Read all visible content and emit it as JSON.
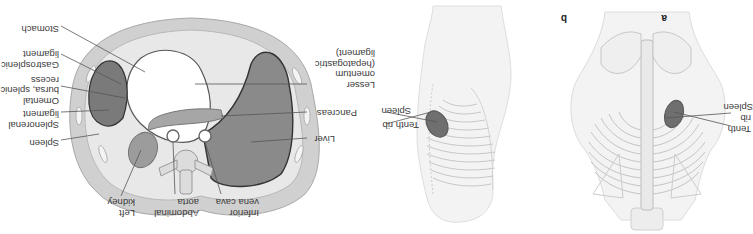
{
  "figure": {
    "orientation": "rotated 180 degrees",
    "panels": [
      {
        "id": "a",
        "letter": "a",
        "view": "posterior view of trunk",
        "labels": {
          "spleen": "Spleen",
          "tenth_rib": "Tenth\nrib"
        }
      },
      {
        "id": "b",
        "letter": "b",
        "view": "left lateral view of trunk",
        "labels": {
          "spleen": "Spleen",
          "tenth_rib": "Tenth rib"
        }
      },
      {
        "id": "c",
        "letter": "",
        "view": "transverse cross-section of upper abdomen",
        "labels": {
          "stomach": "Stomach",
          "gastrosplenic": "Gastrosplenic\nligament",
          "omental_bursa": "Omental\nbursa, splenic\nrecess",
          "splenorenal": "Splenorenal\nligament",
          "spleen": "Spleen",
          "left_kidney": "Left\nkidney",
          "abdominal_aorta": "Abdominal\naorta",
          "ivc": "Inferior\nvena cava",
          "liver": "Liver",
          "pancreas": "Pancreas",
          "lesser_omentum": "Lesser\nomentum\n(hepatogastric\nligament)"
        }
      }
    ],
    "colors": {
      "organ_dark": "#6f6f6f",
      "organ_mid": "#9a9a9a",
      "body_wall": "#cfcfcf",
      "inner_light": "#e6e6e6",
      "line": "#555555",
      "sketch": "#bdbdbd"
    }
  }
}
